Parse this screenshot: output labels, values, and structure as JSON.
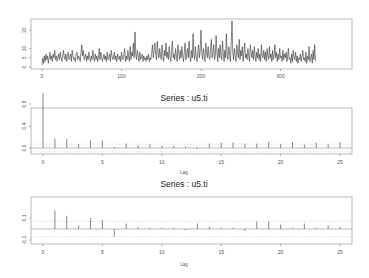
{
  "chart_data": [
    {
      "type": "line",
      "title": "",
      "xlabel": "",
      "ylabel": "",
      "xticks": [
        0,
        100,
        200,
        300
      ],
      "yticks": [
        0,
        5,
        10,
        20
      ],
      "xlim": [
        -10,
        380
      ],
      "ylim": [
        0,
        27
      ],
      "grid": false,
      "values": [
        1,
        5,
        2,
        6,
        3,
        7,
        4,
        6,
        2,
        5,
        8,
        4,
        6,
        3,
        7,
        5,
        9,
        4,
        6,
        3,
        5,
        7,
        4,
        8,
        5,
        3,
        6,
        9,
        5,
        4,
        7,
        3,
        6,
        8,
        4,
        5,
        7,
        3,
        9,
        6,
        4,
        5,
        3,
        7,
        8,
        4,
        6,
        5,
        3,
        8,
        12,
        6,
        9,
        4,
        5,
        7,
        3,
        6,
        4,
        8,
        5,
        3,
        6,
        4,
        9,
        5,
        3,
        7,
        4,
        6,
        3,
        5,
        10,
        4,
        8,
        6,
        3,
        5,
        7,
        4,
        6,
        3,
        8,
        4,
        5,
        7,
        3,
        9,
        6,
        4,
        5,
        8,
        4,
        6,
        3,
        7,
        5,
        4,
        6,
        3,
        8,
        5,
        4,
        7,
        10,
        3,
        6,
        4,
        9,
        5,
        3,
        11,
        4,
        8,
        6,
        13,
        5,
        19,
        7,
        4,
        9,
        6,
        3,
        8,
        4,
        5,
        7,
        3,
        6,
        4,
        5,
        3,
        6,
        4,
        7,
        3,
        5,
        4,
        8,
        12,
        5,
        9,
        13,
        7,
        4,
        14,
        8,
        5,
        10,
        6,
        4,
        12,
        7,
        3,
        9,
        6,
        13,
        5,
        8,
        4,
        11,
        6,
        3,
        9,
        14,
        5,
        7,
        4,
        10,
        6,
        3,
        12,
        8,
        4,
        9,
        5,
        11,
        6,
        3,
        8,
        13,
        4,
        7,
        10,
        5,
        14,
        6,
        3,
        9,
        5,
        18,
        7,
        4,
        11,
        6,
        3,
        8,
        12,
        5,
        9,
        20,
        7,
        4,
        10,
        6,
        3,
        13,
        8,
        5,
        11,
        6,
        4,
        9,
        15,
        5,
        7,
        12,
        4,
        6,
        17,
        8,
        3,
        10,
        5,
        12,
        6,
        4,
        14,
        7,
        3,
        9,
        5,
        18,
        6,
        4,
        11,
        7,
        3,
        13,
        25,
        8,
        4,
        10,
        6,
        3,
        12,
        7,
        5,
        15,
        4,
        9,
        6,
        11,
        3,
        8,
        13,
        5,
        7,
        4,
        10,
        6,
        3,
        12,
        8,
        5,
        9,
        4,
        11,
        6,
        3,
        8,
        5,
        10,
        4,
        7,
        3,
        12,
        6,
        5,
        9,
        4,
        8,
        3,
        10,
        6,
        4,
        11,
        5,
        7,
        3,
        9,
        4,
        6,
        12,
        5,
        8,
        3,
        7,
        4,
        10,
        5,
        6,
        3,
        9,
        4,
        7,
        5,
        8,
        3,
        6,
        10,
        4,
        5,
        2,
        7,
        3,
        9,
        5,
        4,
        8,
        3,
        6,
        2,
        5,
        4,
        7,
        3,
        6,
        9,
        4,
        5,
        3,
        8,
        2,
        6,
        4,
        11,
        3,
        5,
        7,
        2,
        9,
        4,
        12,
        3
      ]
    },
    {
      "type": "bar",
      "title": "Series : u5.ti",
      "xlabel": "Lag",
      "ylabel": "",
      "categories": [
        0,
        1,
        2,
        3,
        4,
        5,
        6,
        7,
        8,
        9,
        10,
        11,
        12,
        13,
        14,
        15,
        16,
        17,
        18,
        19,
        20,
        21,
        22,
        23,
        24,
        25
      ],
      "values": [
        1.0,
        0.17,
        0.16,
        0.07,
        0.14,
        0.14,
        0.02,
        0.08,
        0.05,
        0.07,
        0.04,
        0.04,
        0.03,
        -0.02,
        0.08,
        0.1,
        0.1,
        0.08,
        0.08,
        0.11,
        0.07,
        0.11,
        0.06,
        0.1,
        0.07,
        0.11
      ],
      "xticks": [
        0,
        5,
        10,
        15,
        20,
        25
      ],
      "yticks": [
        0.0,
        0.4,
        0.8
      ],
      "ylim": [
        -0.12,
        1.05
      ],
      "ci": 0.07,
      "grid": false
    },
    {
      "type": "bar",
      "title": "Series : u5.ti",
      "xlabel": "Lag",
      "ylabel": "",
      "categories": [
        1,
        2,
        3,
        4,
        5,
        6,
        7,
        8,
        9,
        10,
        11,
        12,
        13,
        14,
        15,
        16,
        17,
        18,
        19,
        20,
        21,
        22,
        23,
        24,
        25
      ],
      "values": [
        0.17,
        0.12,
        0.03,
        0.1,
        0.08,
        -0.07,
        0.05,
        0.02,
        0.01,
        0.01,
        0.01,
        -0.01,
        0.05,
        0.02,
        0.01,
        0.01,
        -0.02,
        0.07,
        0.07,
        0.04,
        0.01,
        0.05,
        0.01,
        0.03,
        0.02
      ],
      "values_extra_note": "",
      "xticks": [
        0,
        5,
        10,
        15,
        20,
        25
      ],
      "yticks": [
        -0.1,
        0.1
      ],
      "ylim": [
        -0.13,
        0.2
      ],
      "ci": 0.07,
      "grid": false
    }
  ],
  "labels": {
    "title_mid": "Series : u5.ti",
    "title_bot": "Series : u5.ti",
    "lag_mid": "Lag",
    "lag_bot": "Lag"
  }
}
